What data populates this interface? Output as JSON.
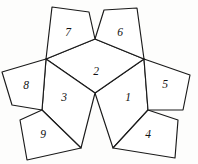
{
  "figure": {
    "name": "pentagon-net-diagram",
    "type": "geometric-net",
    "background_color": "#fdfdfc",
    "stroke_color": "#1a1a1a",
    "fill_color": "#ffffff",
    "width": 198,
    "height": 164,
    "faces": [
      {
        "label": "1",
        "label_x": 128,
        "label_y": 98,
        "points": "95,93 144,59 148,110 113,148 95,93"
      },
      {
        "label": "2",
        "label_x": 96,
        "label_y": 72,
        "points": "95,39 144,59 95,93 46,59 95,39"
      },
      {
        "label": "3",
        "label_x": 64,
        "label_y": 98,
        "points": "95,93 46,59 42,110 81,148 95,93"
      },
      {
        "label": "4",
        "label_x": 148,
        "label_y": 135,
        "points": "148,110 178,120 175,158 113,148 148,110"
      },
      {
        "label": "5",
        "label_x": 165,
        "label_y": 85,
        "points": "144,59 190,75 183,110 148,110 144,59"
      },
      {
        "label": "6",
        "label_x": 120,
        "label_y": 33,
        "points": "95,39 104,10 137,8 144,59 95,39"
      },
      {
        "label": "7",
        "label_x": 68,
        "label_y": 33,
        "points": "95,39 46,59 52,7 89,12 95,39"
      },
      {
        "label": "8",
        "label_x": 26,
        "label_y": 86,
        "points": "46,59 2,72 12,105 42,110 46,59"
      },
      {
        "label": "9",
        "label_x": 43,
        "label_y": 135,
        "points": "42,110 81,148 27,160 20,120 42,110"
      }
    ]
  }
}
